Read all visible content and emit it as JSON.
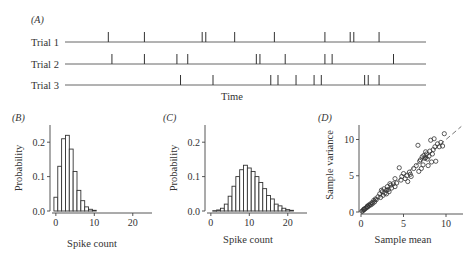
{
  "chart_data": [
    {
      "panel": "(A)",
      "type": "scatter",
      "title": "",
      "xlabel": "Time",
      "ylabel": "",
      "trials": [
        {
          "label": "Trial 1",
          "spike_times": [
            0.12,
            0.22,
            0.38,
            0.39,
            0.47,
            0.58,
            0.72,
            0.79,
            0.8,
            0.87
          ]
        },
        {
          "label": "Trial 2",
          "spike_times": [
            0.13,
            0.22,
            0.31,
            0.34,
            0.53,
            0.54,
            0.61,
            0.72,
            0.74,
            0.91
          ]
        },
        {
          "label": "Trial 3",
          "spike_times": [
            0.32,
            0.41,
            0.57,
            0.59,
            0.64,
            0.69,
            0.71,
            0.83,
            0.84,
            0.87
          ]
        }
      ],
      "xlim": [
        0,
        1
      ]
    },
    {
      "panel": "(B)",
      "type": "bar",
      "xlabel": "Spike count",
      "ylabel": "Probability",
      "categories": [
        0,
        1,
        2,
        3,
        4,
        5,
        6,
        7,
        8,
        9,
        10
      ],
      "values": [
        0.04,
        0.13,
        0.21,
        0.22,
        0.18,
        0.115,
        0.06,
        0.03,
        0.012,
        0.005,
        0.002
      ],
      "xticks": [
        "0",
        "10",
        "20"
      ],
      "yticks": [
        "0.0",
        "0.1",
        "0.2"
      ],
      "xlim": [
        -1,
        25
      ],
      "ylim": [
        0,
        0.25
      ]
    },
    {
      "panel": "(C)",
      "type": "bar",
      "xlabel": "Spike count",
      "ylabel": "Probability",
      "categories": [
        1,
        2,
        3,
        4,
        5,
        6,
        7,
        8,
        9,
        10,
        11,
        12,
        13,
        14,
        15,
        16,
        17,
        18,
        19,
        20,
        21
      ],
      "values": [
        0.001,
        0.003,
        0.008,
        0.02,
        0.043,
        0.072,
        0.1,
        0.12,
        0.133,
        0.125,
        0.115,
        0.1,
        0.083,
        0.065,
        0.045,
        0.035,
        0.02,
        0.015,
        0.008,
        0.004,
        0.002
      ],
      "xticks": [
        "0",
        "10",
        "20"
      ],
      "yticks": [
        "0.0",
        "0.1",
        "0.2"
      ],
      "xlim": [
        -1,
        25
      ],
      "ylim": [
        0,
        0.25
      ]
    },
    {
      "panel": "(D)",
      "type": "scatter",
      "xlabel": "Sample mean",
      "ylabel": "Sample variance",
      "xticks": [
        "0",
        "5",
        "10"
      ],
      "yticks": [
        "0",
        "5",
        "10"
      ],
      "xlim": [
        0,
        12
      ],
      "ylim": [
        0,
        12
      ],
      "reference_line": "y = x (dashed)",
      "points": [
        [
          0.1,
          0.1
        ],
        [
          0.2,
          0.15
        ],
        [
          0.3,
          0.3
        ],
        [
          0.35,
          0.4
        ],
        [
          0.4,
          0.35
        ],
        [
          0.5,
          0.5
        ],
        [
          0.6,
          0.55
        ],
        [
          0.7,
          0.7
        ],
        [
          0.75,
          0.8
        ],
        [
          0.8,
          0.7
        ],
        [
          0.9,
          0.95
        ],
        [
          1.0,
          0.9
        ],
        [
          1.1,
          1.1
        ],
        [
          1.2,
          1.0
        ],
        [
          1.3,
          1.3
        ],
        [
          1.4,
          1.2
        ],
        [
          1.5,
          1.6
        ],
        [
          1.6,
          1.4
        ],
        [
          1.7,
          1.8
        ],
        [
          1.8,
          1.7
        ],
        [
          2.0,
          2.1
        ],
        [
          2.2,
          2.5
        ],
        [
          2.3,
          2.0
        ],
        [
          2.5,
          2.8
        ],
        [
          2.6,
          2.3
        ],
        [
          2.7,
          3.2
        ],
        [
          2.8,
          2.6
        ],
        [
          3.0,
          3.0
        ],
        [
          3.0,
          2.5
        ],
        [
          3.1,
          3.5
        ],
        [
          3.2,
          3.1
        ],
        [
          3.3,
          2.8
        ],
        [
          3.5,
          3.7
        ],
        [
          3.6,
          3.3
        ],
        [
          3.8,
          3.9
        ],
        [
          4.0,
          3.5
        ],
        [
          4.0,
          4.6
        ],
        [
          4.2,
          4.0
        ],
        [
          4.5,
          6.1
        ],
        [
          4.7,
          4.4
        ],
        [
          4.8,
          4.9
        ],
        [
          5.0,
          5.3
        ],
        [
          5.2,
          4.6
        ],
        [
          5.4,
          5.0
        ],
        [
          5.5,
          4.2
        ],
        [
          5.7,
          5.5
        ],
        [
          5.8,
          5.2
        ],
        [
          6.2,
          6.0
        ],
        [
          6.5,
          6.4
        ],
        [
          6.7,
          9.2
        ],
        [
          6.8,
          5.6
        ],
        [
          7.0,
          7.2
        ],
        [
          7.1,
          6.0
        ],
        [
          7.2,
          7.6
        ],
        [
          7.3,
          6.5
        ],
        [
          7.4,
          7.8
        ],
        [
          7.5,
          7.4
        ],
        [
          7.6,
          7.5
        ],
        [
          7.7,
          8.0
        ],
        [
          7.8,
          7.3
        ],
        [
          7.9,
          6.4
        ],
        [
          8.0,
          7.7
        ],
        [
          8.1,
          8.4
        ],
        [
          8.2,
          9.9
        ],
        [
          8.3,
          6.9
        ],
        [
          8.5,
          8.6
        ],
        [
          8.6,
          10.1
        ],
        [
          8.7,
          9.0
        ],
        [
          8.8,
          7.0
        ],
        [
          9.0,
          9.4
        ],
        [
          9.2,
          9.0
        ],
        [
          9.4,
          9.6
        ],
        [
          9.6,
          9.1
        ],
        [
          9.8,
          10.8
        ],
        [
          2.4,
          3.0
        ],
        [
          3.4,
          3.9
        ],
        [
          5.9,
          4.9
        ],
        [
          6.9,
          7.0
        ],
        [
          7.6,
          8.3
        ],
        [
          8.4,
          8.0
        ]
      ]
    }
  ]
}
